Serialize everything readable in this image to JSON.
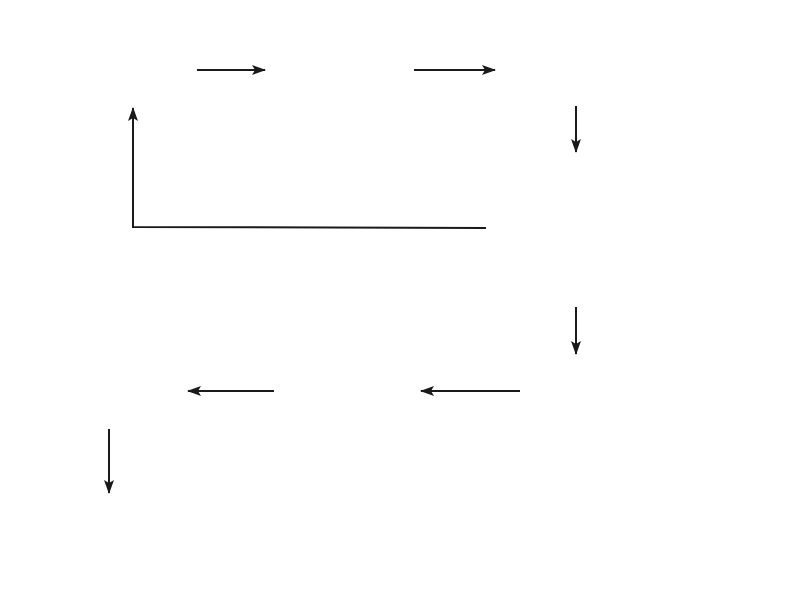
{
  "diagram": {
    "type": "flowchart",
    "nodes": [
      {
        "id": "search_htm",
        "shape": "rectangle",
        "label": "Search.htm"
      },
      {
        "id": "search_idc",
        "shape": "document",
        "label": "Search.idc"
      },
      {
        "id": "directory_htx",
        "shape": "rectangle",
        "label": "Directory.htx"
      },
      {
        "id": "decision",
        "shape": "diamond",
        "label_line1": "CurrentRecord",
        "label_line2": "EQ 0"
      },
      {
        "id": "display_button",
        "shape": "rectangle",
        "label_line1": "Display",
        "label_line2": "AddEntry",
        "label_line3": "Button"
      },
      {
        "id": "addentry_idc",
        "shape": "document",
        "label": "AddEntry.idc"
      },
      {
        "id": "addentry_htx",
        "shape": "rectangle",
        "label": "AddEntry.htx"
      },
      {
        "id": "add2db_idc",
        "shape": "document",
        "label": "Add2DB.idc"
      }
    ],
    "edges": [
      {
        "from": "search_htm",
        "to": "search_idc",
        "label": ""
      },
      {
        "from": "search_idc",
        "to": "directory_htx",
        "label": ""
      },
      {
        "from": "directory_htx",
        "to": "decision",
        "label": ""
      },
      {
        "from": "decision",
        "to": "search_htm",
        "label": "No (Click back button)"
      },
      {
        "from": "decision",
        "to": "display_button",
        "label": "Yes"
      },
      {
        "from": "display_button",
        "to": "addentry_idc",
        "label": ""
      },
      {
        "from": "addentry_idc",
        "to": "addentry_htx",
        "label": ""
      },
      {
        "from": "addentry_htx",
        "to": "add2db_idc",
        "label": ""
      },
      {
        "from": "add2db_idc",
        "to": "directory_htx",
        "label": ""
      }
    ]
  }
}
